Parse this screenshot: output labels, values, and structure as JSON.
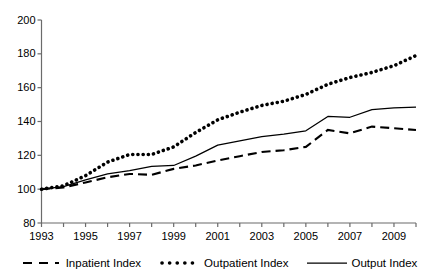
{
  "chart_data": {
    "type": "line",
    "title": "",
    "xlabel": "",
    "ylabel": "",
    "xlim": [
      1993,
      2010
    ],
    "ylim": [
      80,
      200
    ],
    "yticks": [
      80,
      100,
      120,
      140,
      160,
      180,
      200
    ],
    "xticks": [
      1993,
      1994,
      1995,
      1996,
      1997,
      1998,
      1999,
      2000,
      2001,
      2002,
      2003,
      2004,
      2005,
      2006,
      2007,
      2008,
      2009,
      2010
    ],
    "xtick_labels": [
      "1993",
      "",
      "1995",
      "",
      "1997",
      "",
      "1999",
      "",
      "2001",
      "",
      "2003",
      "",
      "2005",
      "",
      "2007",
      "",
      "2009",
      ""
    ],
    "grid": false,
    "legend_position": "bottom",
    "x": [
      1993,
      1994,
      1995,
      1996,
      1997,
      1998,
      1999,
      2000,
      2001,
      2002,
      2003,
      2004,
      2005,
      2006,
      2007,
      2008,
      2009,
      2010
    ],
    "series": [
      {
        "name": "Inpatient Index",
        "style": "dashed",
        "color": "#000000",
        "values": [
          100,
          101,
          104,
          107,
          109,
          108.5,
          112,
          114,
          117,
          119.5,
          122,
          123,
          125,
          135,
          133,
          137,
          136,
          135
        ]
      },
      {
        "name": "Outpatient Index",
        "style": "dotted",
        "color": "#000000",
        "values": [
          100,
          102,
          108,
          116,
          120.5,
          120.5,
          125,
          133.5,
          141,
          145.5,
          149.5,
          152,
          156,
          162,
          166,
          169,
          173,
          179
        ]
      },
      {
        "name": "Output Index",
        "style": "solid",
        "color": "#000000",
        "values": [
          100,
          101.5,
          105.5,
          109,
          111,
          113.5,
          114,
          119.5,
          126,
          128.5,
          131,
          132.5,
          134.5,
          143,
          142.5,
          147,
          148,
          148.5
        ]
      }
    ]
  },
  "legend": {
    "items": [
      {
        "label": "Inpatient Index",
        "marker": "dashed-line-swatch"
      },
      {
        "label": "Outpatient Index",
        "marker": "dotted-line-swatch"
      },
      {
        "label": "Output Index",
        "marker": "solid-line-swatch"
      }
    ]
  },
  "axis": {
    "y_tick_labels": [
      "200",
      "180",
      "160",
      "140",
      "120",
      "100",
      "80"
    ],
    "x_tick_labels": [
      "1993",
      "1995",
      "1997",
      "1999",
      "2001",
      "2003",
      "2005",
      "2007",
      "2009"
    ]
  }
}
